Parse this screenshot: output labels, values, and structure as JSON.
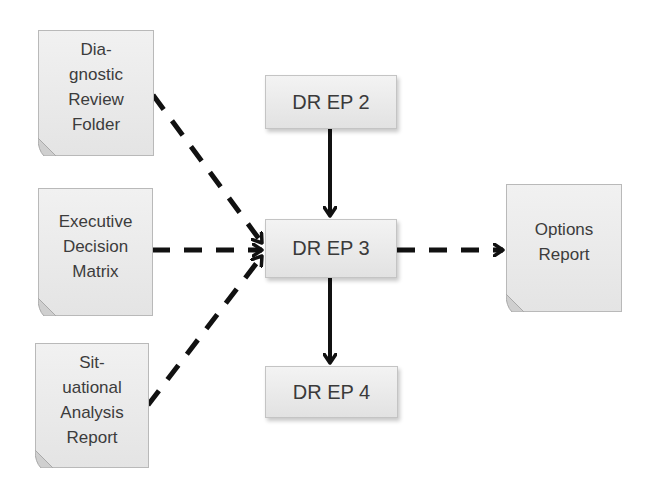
{
  "diagram": {
    "type": "flowchart",
    "inputs": [
      {
        "id": "diagnostic-review-folder",
        "label": "Dia-\ngnostic\nReview\nFolder",
        "shape": "document"
      },
      {
        "id": "executive-decision-matrix",
        "label": "Executive\nDecision\nMatrix",
        "shape": "document"
      },
      {
        "id": "situational-analysis-report",
        "label": "Sit-\nuational\nAnalysis\nReport",
        "shape": "document"
      }
    ],
    "processes": [
      {
        "id": "dr-ep-2",
        "label": "DR EP 2",
        "shape": "rectangle"
      },
      {
        "id": "dr-ep-3",
        "label": "DR EP 3",
        "shape": "rectangle"
      },
      {
        "id": "dr-ep-4",
        "label": "DR EP 4",
        "shape": "rectangle"
      }
    ],
    "outputs": [
      {
        "id": "options-report",
        "label": "Options\nReport",
        "shape": "document"
      }
    ],
    "edges": [
      {
        "from": "diagnostic-review-folder",
        "to": "dr-ep-3",
        "style": "dashed"
      },
      {
        "from": "executive-decision-matrix",
        "to": "dr-ep-3",
        "style": "dashed"
      },
      {
        "from": "situational-analysis-report",
        "to": "dr-ep-3",
        "style": "dashed"
      },
      {
        "from": "dr-ep-2",
        "to": "dr-ep-3",
        "style": "solid"
      },
      {
        "from": "dr-ep-3",
        "to": "dr-ep-4",
        "style": "solid"
      },
      {
        "from": "dr-ep-3",
        "to": "options-report",
        "style": "dashed"
      }
    ]
  },
  "colors": {
    "line": "#111111",
    "box_fill": "#e9e9e9",
    "box_border": "#c0c0c0",
    "text": "#3c3c3c"
  }
}
